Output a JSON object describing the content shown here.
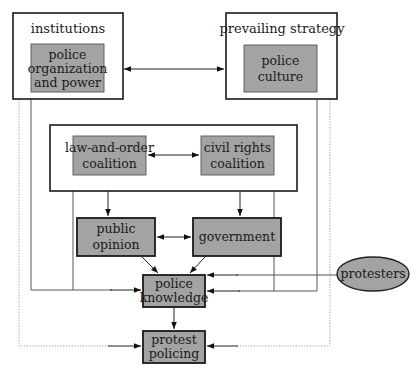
{
  "diagram": {
    "frames": {
      "institutions": {
        "title": "institutions"
      },
      "prevailing_strategy": {
        "title": "prevailing strategy"
      },
      "coalitions": {
        "title": ""
      }
    },
    "nodes": {
      "police_org": {
        "lines": [
          "police",
          "organization",
          "and power"
        ]
      },
      "police_culture": {
        "lines": [
          "police",
          "culture"
        ]
      },
      "law_order": {
        "lines": [
          "law-and-order",
          "coalition"
        ]
      },
      "civil_rights": {
        "lines": [
          "civil rights",
          "coalition"
        ]
      },
      "public_opinion": {
        "lines": [
          "public",
          "opinion"
        ]
      },
      "government": {
        "lines": [
          "government"
        ]
      },
      "police_knowledge": {
        "lines": [
          "police",
          "knowledge"
        ]
      },
      "protest_policing": {
        "lines": [
          "protest",
          "policing"
        ]
      },
      "protesters": {
        "lines": [
          "protesters"
        ]
      }
    },
    "edges": [
      {
        "from": "police_org",
        "to": "police_culture",
        "type": "bidirectional"
      },
      {
        "from": "law_order",
        "to": "civil_rights",
        "type": "bidirectional"
      },
      {
        "from": "coalitions",
        "to": "public_opinion",
        "type": "directed"
      },
      {
        "from": "coalitions",
        "to": "government",
        "type": "directed"
      },
      {
        "from": "public_opinion",
        "to": "government",
        "type": "bidirectional"
      },
      {
        "from": "public_opinion",
        "to": "police_knowledge",
        "type": "directed"
      },
      {
        "from": "government",
        "to": "police_knowledge",
        "type": "directed"
      },
      {
        "from": "police_org",
        "to": "police_knowledge",
        "type": "directed"
      },
      {
        "from": "law_order",
        "to": "police_knowledge",
        "type": "directed"
      },
      {
        "from": "police_culture",
        "to": "police_knowledge",
        "type": "directed"
      },
      {
        "from": "civil_rights",
        "to": "police_knowledge",
        "type": "directed"
      },
      {
        "from": "protesters",
        "to": "police_knowledge",
        "type": "directed"
      },
      {
        "from": "police_knowledge",
        "to": "protest_policing",
        "type": "directed"
      },
      {
        "from": "institutions",
        "to": "protest_policing",
        "type": "dotted"
      },
      {
        "from": "prevailing_strategy",
        "to": "protest_policing",
        "type": "dotted"
      }
    ],
    "colors": {
      "node_fill": "#a3a3a3",
      "frame_stroke": "#1a1a1a",
      "line": "#555555",
      "dotted": "#9a9a9a"
    }
  }
}
